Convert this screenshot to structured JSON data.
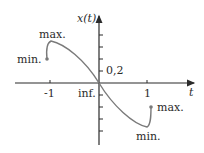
{
  "figure": {
    "y_axis_label": "x(t)",
    "x_axis_label": "t",
    "tick_label_y": "0,2",
    "tick_label_neg1": "-1",
    "tick_label_pos1": "1",
    "annotations": {
      "left_min": "min.",
      "left_max": "max.",
      "inflection": "inf.",
      "right_max": "max.",
      "right_min": "min."
    },
    "colors": {
      "axis": "#2b2b2b",
      "curve": "#7a7a7a"
    }
  }
}
